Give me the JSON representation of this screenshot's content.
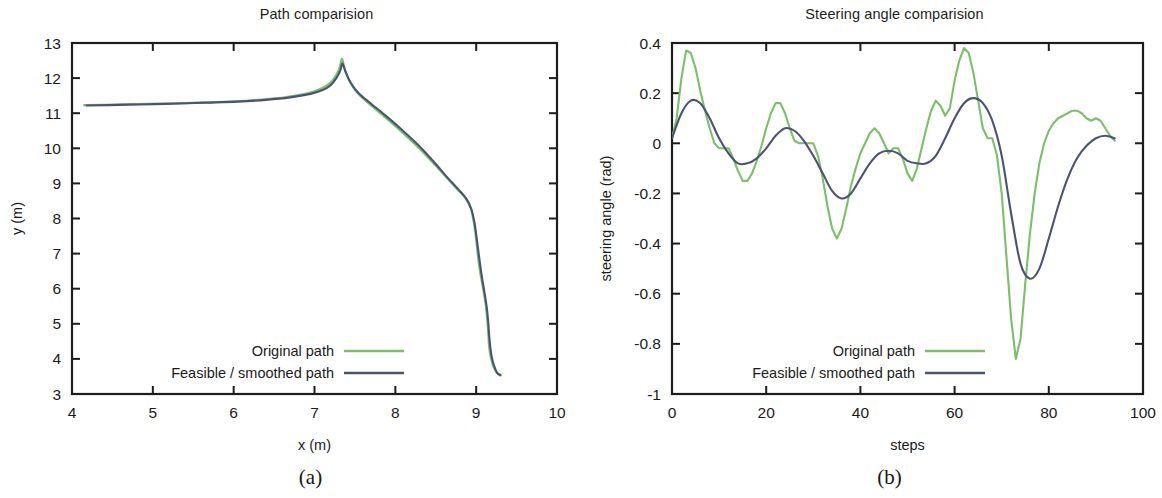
{
  "figure": {
    "panels": [
      {
        "id": "a",
        "caption": "(a)",
        "title": "Path comparision",
        "xlabel": "x (m)",
        "ylabel": "y (m)",
        "xticks": [
          "4",
          "5",
          "6",
          "7",
          "8",
          "9",
          "10"
        ],
        "yticks": [
          "3",
          "4",
          "5",
          "6",
          "7",
          "8",
          "9",
          "10",
          "11",
          "12",
          "13"
        ],
        "legend": [
          {
            "label": "Original path",
            "color": "#7cbf6b"
          },
          {
            "label": "Feasible / smoothed path",
            "color": "#4b5373"
          }
        ]
      },
      {
        "id": "b",
        "caption": "(b)",
        "title": "Steering angle comparision",
        "xlabel": "steps",
        "ylabel": "steering angle (rad)",
        "xticks": [
          "0",
          "20",
          "40",
          "60",
          "80",
          "100"
        ],
        "yticks": [
          "-1",
          "-0.8",
          "-0.6",
          "-0.4",
          "-0.2",
          "0",
          "0.2",
          "0.4"
        ],
        "legend": [
          {
            "label": "Original path",
            "color": "#7cbf6b"
          },
          {
            "label": "Feasible / smoothed path",
            "color": "#4b5373"
          }
        ]
      }
    ]
  },
  "chart_data": [
    {
      "type": "line",
      "title": "Path comparision",
      "xlabel": "x (m)",
      "ylabel": "y (m)",
      "xlim": [
        4,
        10
      ],
      "ylim": [
        3,
        13
      ],
      "grid": false,
      "legend_position": "inside-center-bottom",
      "series": [
        {
          "name": "Original path",
          "color": "#7cbf6b",
          "x": [
            4.15,
            4.4,
            4.8,
            5.2,
            5.6,
            6.0,
            6.35,
            6.65,
            6.9,
            7.05,
            7.18,
            7.26,
            7.31,
            7.34,
            7.37,
            7.43,
            7.52,
            7.66,
            7.84,
            8.04,
            8.24,
            8.44,
            8.62,
            8.76,
            8.86,
            8.93,
            8.97,
            9.0,
            9.02,
            9.05,
            9.09,
            9.12,
            9.14,
            9.15,
            9.16,
            9.18,
            9.21,
            9.25,
            9.3
          ],
          "y": [
            11.23,
            11.24,
            11.26,
            11.28,
            11.3,
            11.34,
            11.39,
            11.46,
            11.56,
            11.67,
            11.84,
            12.05,
            12.3,
            12.55,
            12.3,
            11.92,
            11.6,
            11.3,
            10.95,
            10.55,
            10.12,
            9.65,
            9.2,
            8.85,
            8.6,
            8.3,
            7.9,
            7.4,
            6.95,
            6.45,
            5.95,
            5.5,
            5.05,
            4.7,
            4.35,
            4.05,
            3.8,
            3.62,
            3.55
          ]
        },
        {
          "name": "Feasible / smoothed path",
          "color": "#4b5373",
          "x": [
            4.18,
            4.45,
            4.85,
            5.25,
            5.65,
            6.05,
            6.4,
            6.7,
            6.95,
            7.1,
            7.2,
            7.27,
            7.32,
            7.345,
            7.38,
            7.45,
            7.55,
            7.7,
            7.88,
            8.08,
            8.28,
            8.47,
            8.64,
            8.78,
            8.88,
            8.94,
            8.98,
            9.01,
            9.035,
            9.065,
            9.1,
            9.13,
            9.15,
            9.16,
            9.175,
            9.195,
            9.225,
            9.26,
            9.3
          ],
          "y": [
            11.22,
            11.23,
            11.25,
            11.27,
            11.3,
            11.33,
            11.38,
            11.45,
            11.55,
            11.66,
            11.8,
            12.0,
            12.22,
            12.42,
            12.2,
            11.86,
            11.56,
            11.27,
            10.93,
            10.53,
            10.1,
            9.63,
            9.18,
            8.83,
            8.56,
            8.27,
            7.87,
            7.38,
            6.93,
            6.43,
            5.93,
            5.48,
            5.03,
            4.68,
            4.33,
            4.03,
            3.78,
            3.6,
            3.53
          ]
        }
      ]
    },
    {
      "type": "line",
      "title": "Steering angle comparision",
      "xlabel": "steps",
      "ylabel": "steering angle (rad)",
      "xlim": [
        0,
        100
      ],
      "ylim": [
        -1,
        0.4
      ],
      "grid": false,
      "legend_position": "inside-center-bottom",
      "series": [
        {
          "name": "Original path",
          "color": "#7cbf6b",
          "x": [
            0,
            1,
            2,
            3,
            4,
            5,
            6,
            7,
            8,
            9,
            10,
            11,
            12,
            13,
            14,
            15,
            16,
            17,
            18,
            19,
            20,
            21,
            22,
            23,
            24,
            25,
            26,
            27,
            28,
            29,
            30,
            31,
            32,
            33,
            34,
            35,
            36,
            37,
            38,
            39,
            40,
            41,
            42,
            43,
            44,
            45,
            46,
            47,
            48,
            49,
            50,
            51,
            52,
            53,
            54,
            55,
            56,
            57,
            58,
            59,
            60,
            61,
            62,
            63,
            64,
            65,
            66,
            67,
            68,
            69,
            70,
            71,
            72,
            73,
            74,
            75,
            76,
            77,
            78,
            79,
            80,
            81,
            82,
            83,
            84,
            85,
            86,
            87,
            88,
            89,
            90,
            91,
            92,
            93,
            94
          ],
          "y": [
            0.02,
            0.1,
            0.26,
            0.37,
            0.36,
            0.3,
            0.21,
            0.13,
            0.06,
            0.0,
            -0.02,
            -0.02,
            -0.02,
            -0.06,
            -0.11,
            -0.15,
            -0.15,
            -0.12,
            -0.07,
            -0.01,
            0.06,
            0.12,
            0.16,
            0.16,
            0.12,
            0.06,
            0.01,
            0.0,
            0.0,
            0.0,
            0.0,
            -0.05,
            -0.14,
            -0.25,
            -0.34,
            -0.38,
            -0.34,
            -0.26,
            -0.17,
            -0.1,
            -0.04,
            0.0,
            0.04,
            0.06,
            0.04,
            0.0,
            -0.04,
            -0.02,
            -0.02,
            -0.06,
            -0.12,
            -0.15,
            -0.1,
            -0.02,
            0.06,
            0.13,
            0.17,
            0.15,
            0.11,
            0.14,
            0.25,
            0.33,
            0.38,
            0.36,
            0.28,
            0.17,
            0.06,
            0.02,
            0.02,
            -0.05,
            -0.2,
            -0.45,
            -0.7,
            -0.86,
            -0.78,
            -0.56,
            -0.36,
            -0.2,
            -0.08,
            0.0,
            0.05,
            0.08,
            0.1,
            0.11,
            0.12,
            0.13,
            0.13,
            0.12,
            0.1,
            0.09,
            0.1,
            0.09,
            0.06,
            0.03,
            0.01
          ],
          "min": -0.86,
          "max": 0.38
        },
        {
          "name": "Feasible / smoothed path",
          "color": "#4b5373",
          "x": [
            0,
            2,
            4,
            6,
            8,
            10,
            12,
            14,
            16,
            18,
            20,
            22,
            24,
            26,
            28,
            30,
            32,
            34,
            36,
            38,
            40,
            42,
            44,
            46,
            48,
            50,
            52,
            54,
            56,
            58,
            60,
            62,
            64,
            66,
            68,
            70,
            72,
            74,
            76,
            78,
            80,
            82,
            84,
            86,
            88,
            90,
            92,
            94
          ],
          "y": [
            0.02,
            0.12,
            0.17,
            0.16,
            0.1,
            0.02,
            -0.04,
            -0.08,
            -0.08,
            -0.06,
            -0.02,
            0.03,
            0.06,
            0.05,
            0.01,
            -0.05,
            -0.12,
            -0.19,
            -0.22,
            -0.2,
            -0.14,
            -0.08,
            -0.04,
            -0.03,
            -0.04,
            -0.07,
            -0.08,
            -0.08,
            -0.05,
            0.02,
            0.1,
            0.16,
            0.18,
            0.16,
            0.09,
            -0.05,
            -0.28,
            -0.48,
            -0.54,
            -0.5,
            -0.38,
            -0.25,
            -0.14,
            -0.06,
            -0.01,
            0.02,
            0.03,
            0.02
          ],
          "min": -0.54,
          "max": 0.18
        }
      ]
    }
  ]
}
